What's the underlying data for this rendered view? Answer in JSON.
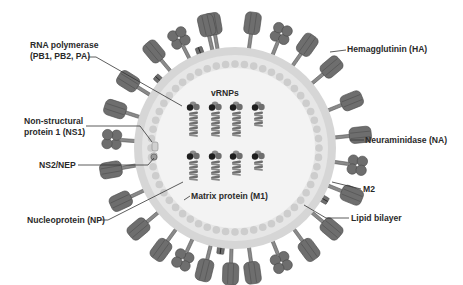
{
  "colors": {
    "background": "#ffffff",
    "interior": "#f3f3f3",
    "membrane_outer": "#d6d6d6",
    "membrane_inner": "#e6e6e6",
    "matrix_bead": "#cdcdcd",
    "protein_dark": "#6e6e6e",
    "protein_mid": "#8a8a8a",
    "protein_stroke": "#4a4a4a",
    "polymerase": "#1e1e1e",
    "leader_line": "#333333",
    "text": "#2a2a2a"
  },
  "labels": {
    "rna_polymerase": {
      "line1": "RNA polymerase",
      "line2": "(PB1, PB2, PA)"
    },
    "ns1": {
      "line1": "Non-structural",
      "line2": "protein 1 (NS1)"
    },
    "ns2": "NS2/NEP",
    "nucleoprotein": "Nucleoprotein (NP)",
    "vrnps": "vRNPs",
    "matrix": "Matrix protein (M1)",
    "hemagglutinin": "Hemagglutinin (HA)",
    "neuraminidase": "Neuraminidase (NA)",
    "m2": "M2",
    "lipid_bilayer": "Lipid bilayer"
  },
  "virion": {
    "center": [
      235,
      148
    ],
    "membrane_outer_radius": 101,
    "membrane_inner_radius": 89,
    "matrix_bead_radius": 84,
    "matrix_bead_count": 56,
    "interior_radius": 80
  },
  "surface_proteins": [
    {
      "type": "HA",
      "angle": -100
    },
    {
      "type": "HA",
      "angle": -82
    },
    {
      "type": "NA",
      "angle": -68
    },
    {
      "type": "HA",
      "angle": -55
    },
    {
      "type": "HA",
      "angle": -40
    },
    {
      "type": "HA",
      "angle": -22
    },
    {
      "type": "HA",
      "angle": -6
    },
    {
      "type": "NA",
      "angle": 8
    },
    {
      "type": "HA",
      "angle": 22
    },
    {
      "type": "M2",
      "angle": 30
    },
    {
      "type": "HA",
      "angle": 40
    },
    {
      "type": "HA",
      "angle": 54
    },
    {
      "type": "NA",
      "angle": 68
    },
    {
      "type": "HA",
      "angle": 82
    },
    {
      "type": "HA",
      "angle": 92
    },
    {
      "type": "M2",
      "angle": 98
    },
    {
      "type": "HA",
      "angle": 104
    },
    {
      "type": "NA",
      "angle": 115
    },
    {
      "type": "HA",
      "angle": 126
    },
    {
      "type": "HA",
      "angle": 140
    },
    {
      "type": "HA",
      "angle": 155
    },
    {
      "type": "HA",
      "angle": 170
    },
    {
      "type": "NA",
      "angle": 184
    },
    {
      "type": "HA",
      "angle": 198
    },
    {
      "type": "HA",
      "angle": 212
    },
    {
      "type": "M2",
      "angle": 222
    },
    {
      "type": "HA",
      "angle": 230
    },
    {
      "type": "NA",
      "angle": 243
    },
    {
      "type": "HA",
      "angle": 257
    },
    {
      "type": "M2",
      "angle": 250
    }
  ],
  "vrnps": [
    {
      "x": 190,
      "y": 104,
      "segments": 5
    },
    {
      "x": 212,
      "y": 104,
      "segments": 5
    },
    {
      "x": 233,
      "y": 104,
      "segments": 5
    },
    {
      "x": 255,
      "y": 104,
      "segments": 3
    },
    {
      "x": 190,
      "y": 153,
      "segments": 4
    },
    {
      "x": 212,
      "y": 153,
      "segments": 4
    },
    {
      "x": 233,
      "y": 153,
      "segments": 3
    },
    {
      "x": 255,
      "y": 153,
      "segments": 2
    }
  ],
  "ns1_markers": [
    {
      "x": 152,
      "y": 142,
      "w": 6,
      "h": 9
    },
    {
      "x": 151,
      "y": 153,
      "w": 6,
      "h": 7
    }
  ],
  "ns2_marker": {
    "x": 154,
    "y": 157,
    "r": 3
  }
}
